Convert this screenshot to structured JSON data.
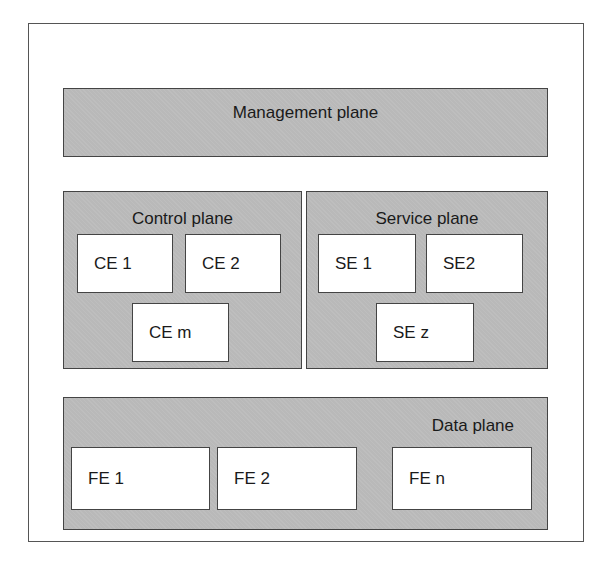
{
  "diagram": {
    "management_plane": {
      "label": "Management plane"
    },
    "control_plane": {
      "label": "Control plane",
      "elements": [
        "CE 1",
        "CE 2",
        "CE m"
      ]
    },
    "service_plane": {
      "label": "Service plane",
      "elements": [
        "SE 1",
        "SE2",
        "SE z"
      ]
    },
    "data_plane": {
      "label": "Data plane",
      "elements": [
        "FE 1",
        "FE 2",
        "FE n"
      ]
    },
    "colors": {
      "plane_fill": "#b9b9b9",
      "element_fill": "#ffffff",
      "border": "#444444"
    }
  }
}
